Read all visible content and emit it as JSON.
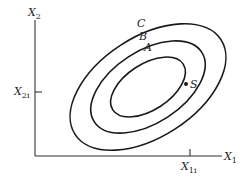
{
  "diagram": {
    "axes": {
      "y_label_main": "X",
      "y_label_sub": "2",
      "x_label_main": "X",
      "x_label_sub": "1",
      "y_tick_label_main": "X",
      "y_tick_label_sub": "2i",
      "x_tick_label_main": "X",
      "x_tick_label_sub": "1i"
    },
    "contours": [
      {
        "label": "A"
      },
      {
        "label": "B"
      },
      {
        "label": "C"
      }
    ],
    "point": {
      "label": "S"
    },
    "colors": {
      "line": "#1a1a1a",
      "background": "#ffffff"
    }
  }
}
